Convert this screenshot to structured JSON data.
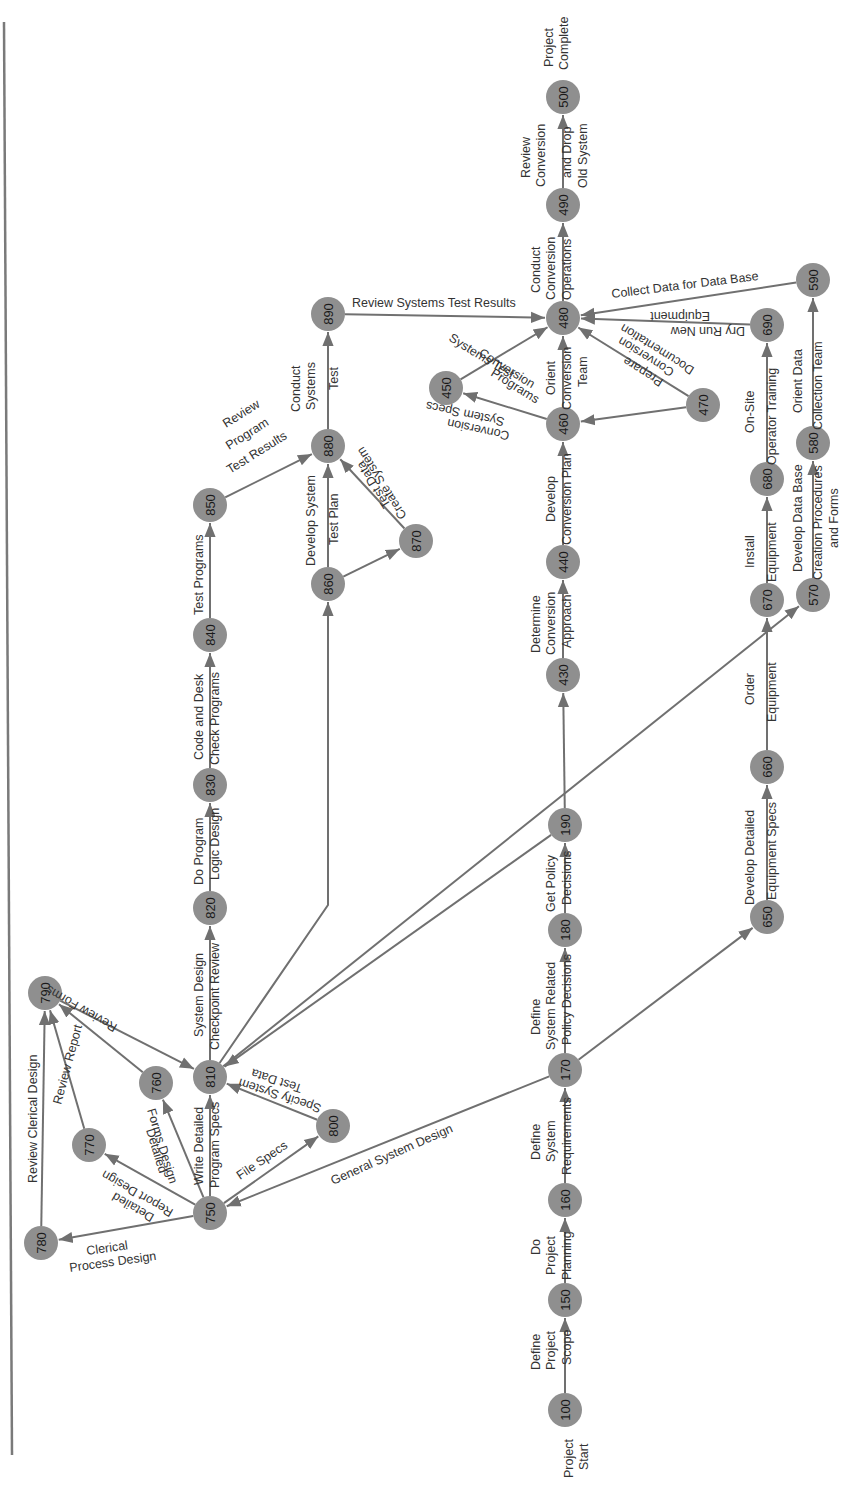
{
  "diagram": {
    "type": "PERT network (rotated 90° counter-clockwise on page)",
    "colors": {
      "node_fill": "#8f8f8f",
      "edge": "#707070",
      "text": "#333333",
      "background": "#ffffff"
    },
    "endpoints": {
      "start": [
        "Project",
        "Start"
      ],
      "end": [
        "Project",
        "Complete"
      ]
    },
    "nodes": [
      {
        "id": "100",
        "x": 565,
        "y": 1410
      },
      {
        "id": "150",
        "x": 565,
        "y": 1300
      },
      {
        "id": "160",
        "x": 565,
        "y": 1200
      },
      {
        "id": "170",
        "x": 565,
        "y": 1070
      },
      {
        "id": "180",
        "x": 565,
        "y": 930
      },
      {
        "id": "190",
        "x": 565,
        "y": 825
      },
      {
        "id": "430",
        "x": 563,
        "y": 675
      },
      {
        "id": "440",
        "x": 563,
        "y": 562
      },
      {
        "id": "450",
        "x": 446,
        "y": 388
      },
      {
        "id": "460",
        "x": 563,
        "y": 424
      },
      {
        "id": "470",
        "x": 703,
        "y": 405
      },
      {
        "id": "480",
        "x": 563,
        "y": 318
      },
      {
        "id": "490",
        "x": 563,
        "y": 205
      },
      {
        "id": "500",
        "x": 563,
        "y": 97
      },
      {
        "id": "570",
        "x": 813,
        "y": 595
      },
      {
        "id": "580",
        "x": 813,
        "y": 443
      },
      {
        "id": "590",
        "x": 813,
        "y": 280
      },
      {
        "id": "650",
        "x": 767,
        "y": 917
      },
      {
        "id": "660",
        "x": 767,
        "y": 767
      },
      {
        "id": "670",
        "x": 767,
        "y": 600
      },
      {
        "id": "680",
        "x": 767,
        "y": 479
      },
      {
        "id": "690",
        "x": 767,
        "y": 325
      },
      {
        "id": "750",
        "x": 210,
        "y": 1213
      },
      {
        "id": "760",
        "x": 156,
        "y": 1083
      },
      {
        "id": "770",
        "x": 89,
        "y": 1145
      },
      {
        "id": "780",
        "x": 41,
        "y": 1243
      },
      {
        "id": "790",
        "x": 45,
        "y": 993
      },
      {
        "id": "800",
        "x": 333,
        "y": 1126
      },
      {
        "id": "810",
        "x": 210,
        "y": 1077
      },
      {
        "id": "820",
        "x": 210,
        "y": 908
      },
      {
        "id": "830",
        "x": 210,
        "y": 785
      },
      {
        "id": "840",
        "x": 210,
        "y": 635
      },
      {
        "id": "850",
        "x": 210,
        "y": 505
      },
      {
        "id": "860",
        "x": 328,
        "y": 584
      },
      {
        "id": "870",
        "x": 416,
        "y": 541
      },
      {
        "id": "880",
        "x": 328,
        "y": 446
      },
      {
        "id": "890",
        "x": 328,
        "y": 314
      }
    ],
    "edges": [
      {
        "from": "100",
        "to": "150",
        "label": [
          "Define",
          "Project",
          "Scope"
        ]
      },
      {
        "from": "150",
        "to": "160",
        "label": [
          "Do",
          "Project",
          "Planning"
        ]
      },
      {
        "from": "160",
        "to": "170",
        "label": [
          "Define",
          "System",
          "Requirements"
        ]
      },
      {
        "from": "170",
        "to": "180",
        "label": [
          "Define",
          "System Related",
          "Policy Decisions"
        ]
      },
      {
        "from": "180",
        "to": "190",
        "label": [
          "Get Policy",
          "Decisions"
        ]
      },
      {
        "from": "190",
        "to": "430",
        "label": []
      },
      {
        "from": "430",
        "to": "440",
        "label": [
          "Determine",
          "Conversion",
          "Approach"
        ]
      },
      {
        "from": "440",
        "to": "460",
        "label": [
          "Develop",
          "Conversion Plan"
        ]
      },
      {
        "from": "460",
        "to": "450",
        "label": [
          "Conversion",
          "System Specs"
        ]
      },
      {
        "from": "450",
        "to": "480",
        "label": [
          "Systems Test",
          "Conversion",
          "Programs"
        ]
      },
      {
        "from": "460",
        "to": "480",
        "label": [
          "Orient",
          "Conversion",
          "Team"
        ]
      },
      {
        "from": "470",
        "to": "460",
        "label": []
      },
      {
        "from": "470",
        "to": "480",
        "label": [
          "Prepare",
          "Conversion",
          "Documentation"
        ]
      },
      {
        "from": "480",
        "to": "490",
        "label": [
          "Conduct",
          "Conversion",
          "Operations"
        ]
      },
      {
        "from": "490",
        "to": "500",
        "label": [
          "Review",
          "Conversion",
          "and Drop",
          "Old System"
        ]
      },
      {
        "from": "590",
        "to": "480",
        "label": [
          "Collect Data for Data Base"
        ]
      },
      {
        "from": "690",
        "to": "480",
        "label": [
          "Dry Run New",
          "Equipment"
        ]
      },
      {
        "from": "890",
        "to": "480",
        "label": [
          "Review Systems Test Results"
        ]
      },
      {
        "from": "170",
        "to": "650",
        "label": []
      },
      {
        "from": "650",
        "to": "660",
        "label": [
          "Develop Detailed",
          "Equipment Specs"
        ]
      },
      {
        "from": "660",
        "to": "670",
        "label": [
          "Order",
          "Equipment"
        ]
      },
      {
        "from": "670",
        "to": "680",
        "label": [
          "Install",
          "Equipment"
        ]
      },
      {
        "from": "680",
        "to": "690",
        "label": [
          "On-Site",
          "Operator Training"
        ]
      },
      {
        "from": "810",
        "to": "570",
        "label": []
      },
      {
        "from": "570",
        "to": "580",
        "label": [
          "Develop Data Base",
          "Creation Procedures",
          "and Forms"
        ]
      },
      {
        "from": "580",
        "to": "590",
        "label": [
          "Orient Data",
          "Collection Team"
        ]
      },
      {
        "from": "170",
        "to": "750",
        "label": [
          "General System Design"
        ]
      },
      {
        "from": "750",
        "to": "780",
        "label": [
          "Clerical",
          "Process Design"
        ]
      },
      {
        "from": "750",
        "to": "770",
        "label": [
          "Detailed",
          "Report Design"
        ]
      },
      {
        "from": "750",
        "to": "760",
        "label": [
          "Detailed",
          "Forms Design"
        ]
      },
      {
        "from": "750",
        "to": "810",
        "label": [
          "Write Detailed",
          "Program Specs"
        ]
      },
      {
        "from": "750",
        "to": "800",
        "label": [
          "File Specs"
        ]
      },
      {
        "from": "800",
        "to": "810",
        "label": [
          "Specify System",
          "Test Data"
        ]
      },
      {
        "from": "780",
        "to": "790",
        "label": [
          "Review Clerical Design"
        ]
      },
      {
        "from": "770",
        "to": "790",
        "label": [
          "Review Report"
        ]
      },
      {
        "from": "760",
        "to": "790",
        "label": [
          "Review Forms"
        ]
      },
      {
        "from": "790",
        "to": "810",
        "label": []
      },
      {
        "from": "190",
        "to": "810",
        "label": []
      },
      {
        "from": "810",
        "to": "820",
        "label": [
          "System Design",
          "Checkpoint Review"
        ]
      },
      {
        "from": "820",
        "to": "830",
        "label": [
          "Do Program",
          "Logic Design"
        ]
      },
      {
        "from": "830",
        "to": "840",
        "label": [
          "Code and Desk",
          "Check Programs"
        ]
      },
      {
        "from": "840",
        "to": "850",
        "label": [
          "Test Programs"
        ]
      },
      {
        "from": "850",
        "to": "880",
        "label": [
          "Review",
          "Program",
          "Test Results"
        ]
      },
      {
        "from": "810",
        "to": "860",
        "label": []
      },
      {
        "from": "860",
        "to": "880",
        "label": [
          "Develop System",
          "Test Plan"
        ]
      },
      {
        "from": "860",
        "to": "870",
        "label": []
      },
      {
        "from": "870",
        "to": "880",
        "label": [
          "Create System",
          "Test Data"
        ]
      },
      {
        "from": "880",
        "to": "890",
        "label": [
          "Conduct",
          "Systems",
          "Test"
        ]
      }
    ]
  }
}
